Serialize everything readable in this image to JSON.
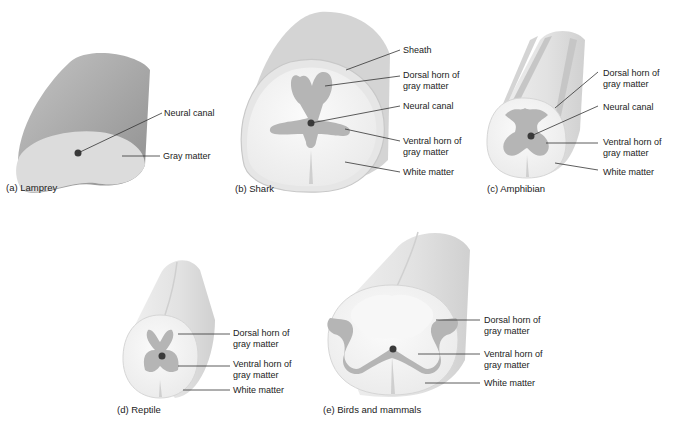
{
  "colors": {
    "background": "#ffffff",
    "cylinder_dark": "#a9a9a9",
    "cylinder_light": "#e6e6e6",
    "white_matter": "#f4f4f4",
    "gray_matter": "#b5b5b5",
    "canal": "#3a3a3a",
    "leader_line": "#333333"
  },
  "panels": {
    "lamprey": {
      "caption": "(a) Lamprey",
      "labels": [
        "Neural canal",
        "Gray matter"
      ]
    },
    "shark": {
      "caption": "(b) Shark",
      "labels": [
        "Sheath",
        "Dorsal horn of\ngray matter",
        "Neural canal",
        "Ventral horn of\ngray matter",
        "White matter"
      ]
    },
    "amphibian": {
      "caption": "(c) Amphibian",
      "labels": [
        "Dorsal horn of\ngray matter",
        "Neural canal",
        "Ventral horn of\ngray matter",
        "White matter"
      ]
    },
    "reptile": {
      "caption": "(d) Reptile",
      "labels": [
        "Dorsal horn of\ngray matter",
        "Ventral horn of\ngray matter",
        "White matter"
      ]
    },
    "birds_mammals": {
      "caption": "(e) Birds and mammals",
      "labels": [
        "Dorsal horn of\ngray matter",
        "Ventral horn of\ngray matter",
        "White matter"
      ]
    }
  }
}
